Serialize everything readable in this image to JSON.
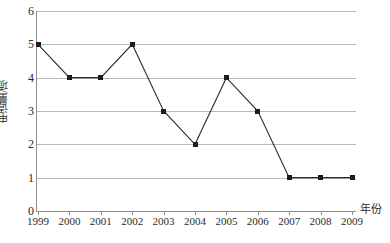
{
  "chart_data": {
    "type": "line",
    "title": "",
    "subtitle": "",
    "xlabel": "年份",
    "ylabel": "申请量/项",
    "categories": [
      "1999",
      "2000",
      "2001",
      "2002",
      "2003",
      "2004",
      "2005",
      "2006",
      "2007",
      "2008",
      "2009"
    ],
    "values": [
      5,
      4,
      4,
      5,
      3,
      2,
      4,
      3,
      1,
      1,
      1
    ],
    "series": [
      {
        "name": "申请量/项",
        "values": [
          5,
          4,
          4,
          5,
          3,
          2,
          4,
          3,
          1,
          1,
          1
        ]
      }
    ],
    "ylim": [
      0,
      6
    ],
    "yticks": [
      "0",
      "1",
      "2",
      "3",
      "4",
      "5",
      "6"
    ],
    "ytick_values": [
      0,
      1,
      2,
      3,
      4,
      5,
      6
    ],
    "xtick_labels": [
      "1999",
      "2000",
      "2001",
      "2002",
      "2003",
      "2004",
      "2005",
      "2006",
      "2007",
      "2008",
      "2009"
    ],
    "grid": "horizontal",
    "legend": "none",
    "marker": "square",
    "line_color": "#2a2a2a",
    "marker_color": "#1c1c1c",
    "grid_color": "#b9b9b9",
    "axis_color": "#8f8f8f",
    "background": "#ffffff"
  }
}
